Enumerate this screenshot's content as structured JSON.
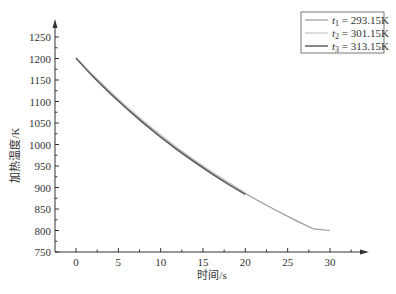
{
  "chart_data": {
    "type": "line",
    "title": "",
    "xlabel": "时间/s",
    "ylabel": "加热温度/K",
    "xlim": [
      -2.2,
      32
    ],
    "ylim": [
      750,
      1285
    ],
    "xticks": [
      0,
      5,
      10,
      15,
      20,
      25,
      30
    ],
    "yticks": [
      750,
      800,
      850,
      900,
      950,
      1000,
      1050,
      1100,
      1150,
      1200,
      1250
    ],
    "grid": false,
    "legend_position": "upper right",
    "series": [
      {
        "name": "t1 = 293.15K",
        "label_var": "t",
        "label_sub": "1",
        "label_val": "= 293.15K",
        "color": "#9a9a9a",
        "width": 1.2,
        "x": [
          0,
          2,
          4,
          6,
          8,
          10,
          12,
          14,
          16,
          18,
          20,
          22,
          24,
          26,
          28,
          30
        ],
        "y": [
          1200,
          1160,
          1122,
          1086,
          1052,
          1020,
          990,
          962,
          935,
          910,
          886,
          864,
          843,
          823,
          804,
          800
        ]
      },
      {
        "name": "t2 = 301.15K",
        "label_var": "t",
        "label_sub": "2",
        "label_val": "= 301.15K",
        "color": "#c4c4c4",
        "width": 1.2,
        "x": [
          0,
          2,
          4,
          6,
          8,
          10,
          12,
          14,
          16,
          18,
          20
        ],
        "y": [
          1202,
          1162,
          1124,
          1088,
          1054,
          1022,
          992,
          964,
          937,
          912,
          888
        ]
      },
      {
        "name": "t3 = 313.15K",
        "label_var": "t",
        "label_sub": "3",
        "label_val": "= 313.15K",
        "color": "#555555",
        "width": 1.4,
        "x": [
          0,
          2,
          4,
          6,
          8,
          10,
          12,
          14,
          16,
          18,
          20
        ],
        "y": [
          1201,
          1158,
          1119,
          1083,
          1049,
          1017,
          987,
          959,
          932,
          907,
          884
        ]
      }
    ]
  }
}
